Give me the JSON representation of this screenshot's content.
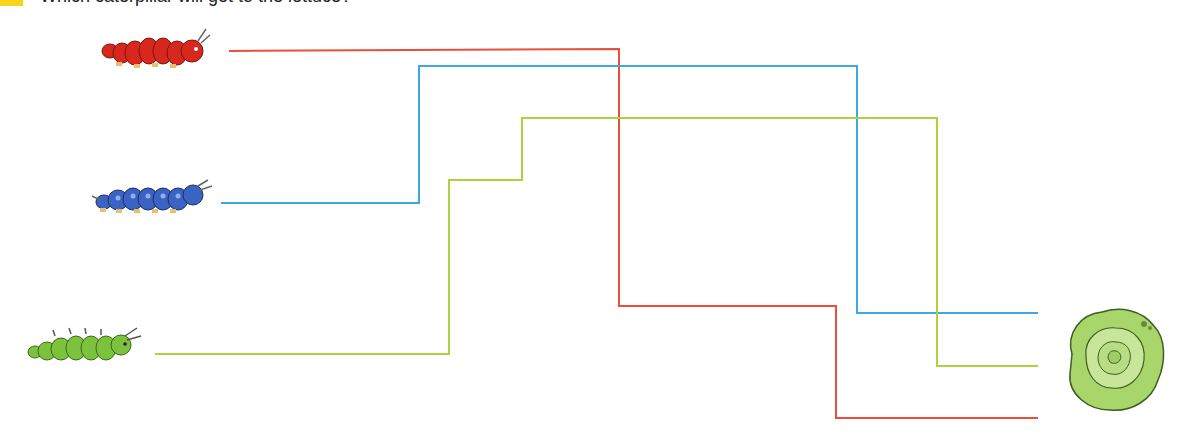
{
  "header": {
    "tag_color": "#f7d51a",
    "instruction_cropped": "Which caterpillar will get to the lettuce?"
  },
  "colors": {
    "red": "#e8503a",
    "blue": "#3fa8e4",
    "green": "#a9d43a"
  },
  "characters": [
    {
      "name": "red-caterpillar",
      "color": "#d8281e",
      "x": 100,
      "y": 27,
      "w": 112,
      "h": 48
    },
    {
      "name": "blue-caterpillar",
      "color": "#3b63c4",
      "x": 90,
      "y": 178,
      "w": 118,
      "h": 42
    },
    {
      "name": "green-caterpillar",
      "color": "#7cc23c",
      "x": 25,
      "y": 326,
      "w": 120,
      "h": 40
    }
  ],
  "target": {
    "name": "lettuce",
    "x": 1062,
    "y": 304,
    "w": 105,
    "h": 110
  },
  "paths": [
    {
      "name": "red-path",
      "color": "#e8503a",
      "points": "229,51 619,49 619,306 836,306 836,418 1038,418"
    },
    {
      "name": "blue-path",
      "color": "#3fa8e4",
      "points": "221,203 419,203 419,66 857,66 857,313 1038,313"
    },
    {
      "name": "green-path",
      "color": "#a9d43a",
      "points": "155,354 449,354 449,180 522,180 522,118 937,118 937,366 1038,366"
    }
  ]
}
